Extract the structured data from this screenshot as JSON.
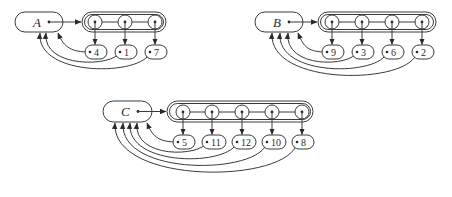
{
  "diagram": {
    "colors": {
      "stroke": "#3a3a3a",
      "background": "#ffffff"
    },
    "sets": [
      {
        "name": "A",
        "header": {
          "x": 15,
          "y": 12,
          "w": 48,
          "h": 20
        },
        "list_box": {
          "x": 82,
          "y": 12,
          "w": 84,
          "h": 20
        },
        "node_x": [
          95,
          125,
          155
        ],
        "node_y": 22,
        "value_y": 52,
        "values": [
          "4",
          "1",
          "7"
        ],
        "back_arrow_targets_x": [
          58,
          46,
          40
        ]
      },
      {
        "name": "B",
        "header": {
          "x": 255,
          "y": 12,
          "w": 48,
          "h": 20
        },
        "list_box": {
          "x": 318,
          "y": 12,
          "w": 118,
          "h": 20
        },
        "node_x": [
          332,
          362,
          392,
          422
        ],
        "node_y": 22,
        "value_y": 52,
        "values": [
          "9",
          "3",
          "6",
          "2"
        ],
        "back_arrow_targets_x": [
          298,
          288,
          280,
          272
        ]
      },
      {
        "name": "C",
        "header": {
          "x": 103,
          "y": 101,
          "w": 49,
          "h": 21
        },
        "list_box": {
          "x": 167,
          "y": 101,
          "w": 146,
          "h": 21
        },
        "node_x": [
          183,
          212,
          242,
          272,
          302
        ],
        "node_y": 112,
        "value_y": 142,
        "values": [
          "5",
          "11",
          "12",
          "10",
          "8"
        ],
        "back_arrow_targets_x": [
          147,
          137,
          130,
          123,
          115
        ]
      }
    ]
  }
}
